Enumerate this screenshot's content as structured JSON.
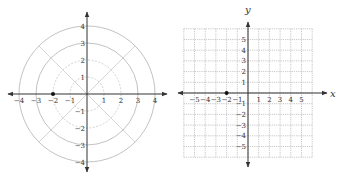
{
  "colors": {
    "axis": "#333333",
    "polar_circle_outer": "#bbbbbb",
    "polar_circle_inner": "#cccccc",
    "polar_ray": "#cccccc",
    "grid": "#b0b0b0",
    "point": "#111111",
    "label": "#333333"
  },
  "polar_plot": {
    "center": [
      87,
      94
    ],
    "unit_px": 17,
    "rings": [
      1,
      2,
      3,
      4
    ],
    "dashed_rings": [
      1,
      2
    ],
    "ray_angles_deg": [
      45,
      135,
      225,
      315
    ],
    "x_axis": {
      "from": 8,
      "to": 167
    },
    "y_axis": {
      "from": 12,
      "to": 172
    },
    "x_tick_labels": [
      "−4",
      "−3",
      "−2",
      "−1",
      "1",
      "2",
      "3",
      "4"
    ],
    "x_tick_values": [
      -4,
      -3,
      -2,
      -1,
      1,
      2,
      3,
      4
    ],
    "y_tick_labels": [
      "4",
      "3",
      "2",
      "1",
      "−1",
      "−2",
      "−3",
      "−4"
    ],
    "y_tick_values": [
      4,
      3,
      2,
      1,
      -1,
      -2,
      -3,
      -4
    ],
    "point": {
      "x": -2,
      "y": 0
    }
  },
  "rect_plot": {
    "center": [
      248,
      93
    ],
    "unit_px": 10.7,
    "grid_range": [
      -6,
      6
    ],
    "x_axis": {
      "from": 178,
      "to": 327,
      "label": "x"
    },
    "y_axis": {
      "from": 22,
      "to": 167,
      "label": "y"
    },
    "x_tick_labels": [
      "−5",
      "−4",
      "−3",
      "−2",
      "−1",
      "1",
      "2",
      "3",
      "4",
      "5"
    ],
    "x_tick_values": [
      -5,
      -4,
      -3,
      -2,
      -1,
      1,
      2,
      3,
      4,
      5
    ],
    "y_tick_labels": [
      "5",
      "4",
      "3",
      "2",
      "1",
      "−1",
      "−2",
      "−3",
      "−4",
      "−5"
    ],
    "y_tick_values": [
      5,
      4,
      3,
      2,
      1,
      -1,
      -2,
      -3,
      -4,
      -5
    ],
    "point": {
      "x": -2,
      "y": 0
    }
  }
}
